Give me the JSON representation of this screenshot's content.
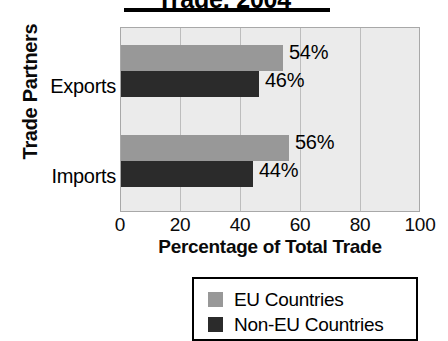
{
  "chart_data": {
    "type": "bar",
    "orientation": "horizontal",
    "title": "Trade, 2004",
    "xlabel": "Percentage of Total Trade",
    "ylabel": "Trade Partners",
    "categories": [
      "Exports",
      "Imports"
    ],
    "series": [
      {
        "name": "EU Countries",
        "color": "#989898",
        "values": [
          54,
          56
        ],
        "labels": [
          "54%",
          "56%"
        ]
      },
      {
        "name": "Non-EU Countries",
        "color": "#2b2b2b",
        "values": [
          46,
          44
        ],
        "labels": [
          "46%",
          "44%"
        ]
      }
    ],
    "xlim": [
      0,
      100
    ],
    "xticks": [
      "0",
      "20",
      "40",
      "60",
      "80",
      "100"
    ],
    "grid": true,
    "legend_position": "bottom"
  },
  "legend": {
    "items": [
      {
        "label": "EU Countries",
        "swatch": "eu-swatch"
      },
      {
        "label": "Non-EU Countries",
        "swatch": "non-eu-swatch"
      }
    ]
  }
}
